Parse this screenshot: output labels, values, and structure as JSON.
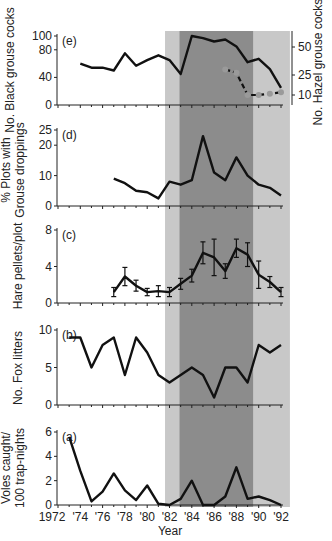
{
  "chart_data": [
    {
      "panel": "e",
      "type": "line",
      "ylabel": "No. Black grouse cocks",
      "y2label": "No. Hazel grouse cocks",
      "yticks": [
        0,
        40,
        80,
        100
      ],
      "y2ticks": [
        10,
        25,
        50
      ],
      "series": [
        {
          "name": "Black grouse cocks",
          "axis": "left",
          "x": [
            1974,
            1975,
            1976,
            1977,
            1978,
            1979,
            1980,
            1981,
            1982,
            1983,
            1984,
            1985,
            1986,
            1987,
            1988,
            1989,
            1990,
            1991,
            1992
          ],
          "values": [
            60,
            54,
            54,
            50,
            75,
            57,
            65,
            72,
            65,
            45,
            100,
            97,
            92,
            95,
            85,
            62,
            67,
            52,
            25
          ]
        },
        {
          "name": "Hazel grouse cocks",
          "axis": "right",
          "x": [
            1987,
            1988,
            1989,
            1990,
            1991,
            1992
          ],
          "values": [
            30,
            27,
            10,
            10,
            11,
            12
          ]
        }
      ]
    },
    {
      "panel": "d",
      "type": "line",
      "ylabel": "% Plots with Grouse droppings",
      "yticks": [
        0,
        10,
        20,
        25
      ],
      "series": [
        {
          "name": "% plots with grouse droppings",
          "x": [
            1977,
            1978,
            1979,
            1980,
            1981,
            1982,
            1983,
            1984,
            1985,
            1986,
            1987,
            1988,
            1989,
            1990,
            1991,
            1992
          ],
          "values": [
            9,
            7.5,
            5,
            4.5,
            2.5,
            8,
            7,
            8.5,
            23,
            11,
            8.5,
            16,
            10,
            7,
            6,
            3.5
          ]
        }
      ]
    },
    {
      "panel": "c",
      "type": "line",
      "ylabel": "Hare pellets/plot",
      "yticks": [
        0,
        4,
        8
      ],
      "error_bars": true,
      "series": [
        {
          "name": "Hare pellets/plot",
          "x": [
            1977,
            1978,
            1979,
            1980,
            1981,
            1982,
            1983,
            1984,
            1985,
            1986,
            1987,
            1988,
            1989,
            1990,
            1991,
            1992
          ],
          "values": [
            1.2,
            2.9,
            1.9,
            1.2,
            1.3,
            1.2,
            2.1,
            3.0,
            5.5,
            5.0,
            3.5,
            6.0,
            5.3,
            3.1,
            2.3,
            1.2
          ],
          "errors": [
            0.5,
            1.0,
            0.6,
            0.4,
            0.6,
            0.5,
            0.6,
            0.7,
            1.2,
            2.0,
            0.8,
            1.0,
            1.3,
            1.5,
            0.6,
            0.5
          ]
        }
      ]
    },
    {
      "panel": "b",
      "type": "line",
      "ylabel": "No. Fox litters",
      "yticks": [
        0,
        5,
        10
      ],
      "series": [
        {
          "name": "Fox litters",
          "x": [
            1973,
            1974,
            1975,
            1976,
            1977,
            1978,
            1979,
            1980,
            1981,
            1982,
            1983,
            1984,
            1985,
            1986,
            1987,
            1988,
            1989,
            1990,
            1991,
            1992
          ],
          "values": [
            9,
            9,
            5,
            8,
            9,
            4,
            9,
            7,
            4,
            3,
            4,
            5,
            4,
            1,
            5,
            5,
            3,
            8,
            7,
            8
          ]
        }
      ]
    },
    {
      "panel": "a",
      "type": "line",
      "ylabel": "Voles caught/ 100 trap-nights",
      "xlabel": "Year",
      "yticks": [
        0,
        2,
        4,
        6
      ],
      "series": [
        {
          "name": "Voles caught per 100 trap-nights",
          "x": [
            1973,
            1974,
            1975,
            1976,
            1977,
            1978,
            1979,
            1980,
            1981,
            1982,
            1983,
            1984,
            1985,
            1986,
            1987,
            1988,
            1989,
            1990,
            1991,
            1992
          ],
          "values": [
            5.6,
            2.8,
            0.3,
            1.1,
            2.6,
            1.2,
            0.4,
            1.6,
            0.1,
            0.0,
            0.5,
            2.0,
            0.0,
            0.0,
            0.7,
            3.1,
            0.5,
            0.7,
            0.4,
            0.0
          ]
        }
      ]
    }
  ],
  "labels": {
    "panel_e": "(e)",
    "panel_d": "(d)",
    "panel_c": "(c)",
    "panel_b": "(b)",
    "panel_a": "(a)",
    "ylabel_e": "No. Black grouse cocks",
    "y2label_e": "No. Hazel grouse cocks",
    "ylabel_d_line1": "% Plots with",
    "ylabel_d_line2": "Grouse droppings",
    "ylabel_c": "Hare pellets/plot",
    "ylabel_b": "No. Fox litters",
    "ylabel_a_line1": "Voles caught/",
    "ylabel_a_line2": "100 trap-nights",
    "xlabel": "Year",
    "xticks": [
      "1972",
      "'74",
      "'76",
      "'78",
      "'80",
      "'82",
      "'84",
      "'86",
      "'88",
      "'90",
      "'92"
    ],
    "yticks_e": [
      "0",
      "40",
      "80",
      "100"
    ],
    "y2ticks_e": [
      "10",
      "25",
      "50"
    ],
    "yticks_d": [
      "0",
      "10",
      "20",
      "25"
    ],
    "yticks_c": [
      "0",
      "4",
      "8"
    ],
    "yticks_b": [
      "0",
      "5",
      "10"
    ],
    "yticks_a": [
      "0",
      "2",
      "4",
      "6"
    ]
  },
  "shading": {
    "light_color": "#c8c8c8",
    "dark_color": "#8c8c8c",
    "light_band_1": [
      1981.6,
      1982.9
    ],
    "dark_band": [
      1982.9,
      1989.5
    ],
    "light_band_2": [
      1989.5,
      1992.8
    ]
  }
}
